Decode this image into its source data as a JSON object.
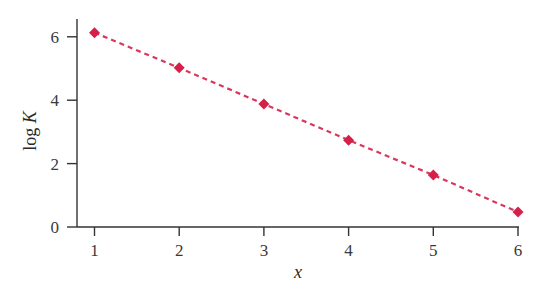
{
  "chart_data": {
    "type": "scatter",
    "title": "",
    "xlabel": "x",
    "ylabel": "log K",
    "ylabel_italic_part": "K",
    "ylabel_roman_part": "log ",
    "x": [
      1,
      2,
      3,
      4,
      5,
      6
    ],
    "series": [
      {
        "name": "log K",
        "marker": "diamond",
        "line": "dashed",
        "values": [
          6.13,
          5.02,
          3.88,
          2.74,
          1.64,
          0.47
        ]
      }
    ],
    "xticks": [
      1,
      2,
      3,
      4,
      5,
      6
    ],
    "yticks": [
      0,
      2,
      4,
      6
    ],
    "xlim": [
      0.8,
      6
    ],
    "ylim": [
      0,
      6.5
    ],
    "grid": false,
    "legend": null,
    "colors": {
      "series": "#d6204a",
      "axis": "#333333",
      "text": "#3a3a3a"
    }
  }
}
